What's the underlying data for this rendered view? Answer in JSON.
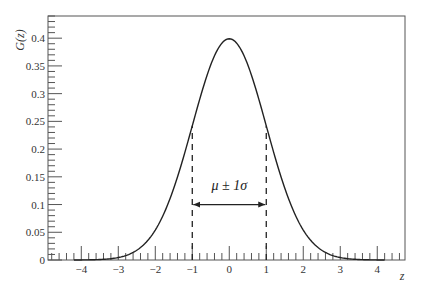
{
  "chart_data": {
    "type": "line",
    "title": "",
    "xlabel": "z",
    "ylabel": "G(z)",
    "xlim": [
      -4.9,
      4.75
    ],
    "ylim": [
      0,
      0.44
    ],
    "grid": false,
    "legend": null,
    "x_ticks": [
      -4,
      -3,
      -2,
      -1,
      0,
      1,
      2,
      3,
      4
    ],
    "x_tick_labels": [
      "−4",
      "−3",
      "−2",
      "−1",
      "0",
      "1",
      "2",
      "3",
      "4"
    ],
    "y_ticks": [
      0,
      0.05,
      0.1,
      0.15,
      0.2,
      0.25,
      0.3,
      0.35,
      0.4
    ],
    "y_tick_labels": [
      "0",
      "0.05",
      "0.1",
      "0.15",
      "0.2",
      "0.25",
      "0.3",
      "0.35",
      "0.4"
    ],
    "series": [
      {
        "name": "Standard normal G(z)",
        "function": "exp(-z^2/2)/sqrt(2*pi)",
        "x": [
          -4.5,
          -4,
          -3.5,
          -3,
          -2.5,
          -2,
          -1.5,
          -1,
          -0.5,
          0,
          0.5,
          1,
          1.5,
          2,
          2.5,
          3,
          3.5,
          4,
          4.5
        ],
        "values": [
          0.0,
          0.0001,
          0.0009,
          0.0044,
          0.0175,
          0.054,
          0.1295,
          0.242,
          0.3521,
          0.3989,
          0.3521,
          0.242,
          0.1295,
          0.054,
          0.0175,
          0.0044,
          0.0009,
          0.0001,
          0.0
        ]
      }
    ],
    "annotations": [
      {
        "type": "dashed-vline",
        "x": -1,
        "y_from": 0,
        "y_to": 0.242
      },
      {
        "type": "dashed-vline",
        "x": 1,
        "y_from": 0,
        "y_to": 0.242
      },
      {
        "type": "double-arrow",
        "x_from": -1,
        "x_to": 1,
        "y": 0.1
      },
      {
        "type": "text",
        "text": "μ ± 1σ",
        "x": 0,
        "y": 0.135
      }
    ]
  },
  "labels": {
    "ylabel": "G(z)",
    "xlabel": "z",
    "annotation": "μ ± 1σ"
  },
  "colors": {
    "curve": "#222222",
    "frame": "#555555",
    "text": "#333333"
  }
}
